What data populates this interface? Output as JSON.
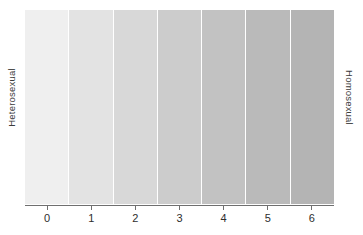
{
  "figure": {
    "left_label": "Heterosexual",
    "right_label": "Homosexual"
  },
  "chart_data": {
    "type": "bar",
    "title": "",
    "subtitle": "",
    "xlabel": "",
    "ylabel": "",
    "categories": [
      "0",
      "1",
      "2",
      "3",
      "4",
      "5",
      "6"
    ],
    "values": [
      1,
      1,
      1,
      1,
      1,
      1,
      1
    ],
    "tick_labels": [
      "0",
      "1",
      "2",
      "3",
      "4",
      "5",
      "6"
    ],
    "axis_left_annotation": "Heterosexual",
    "axis_right_annotation": "Homosexual",
    "band_colors": [
      "#efefef",
      "#e3e3e3",
      "#d8d8d8",
      "#cccccc",
      "#c2c2c2",
      "#bababa",
      "#b4b4b4"
    ],
    "separator_color": "#ffffff",
    "axis_color": "#6f6f6f",
    "grid": false,
    "legend": "none",
    "xlim": [
      -0.5,
      6.5
    ]
  }
}
